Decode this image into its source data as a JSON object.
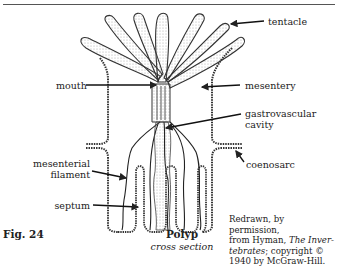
{
  "figure": {
    "number": "Fig. 24",
    "title": "Polyp",
    "subtitle": "cross section"
  },
  "labels": {
    "tentacle": "tentacle",
    "mouth": "mouth",
    "mesentery": "mesentery",
    "gastrovascular_line1": "gastrovascular",
    "gastrovascular_line2": "cavity",
    "coenosarc": "coenosarc",
    "mesenterial_line1": "mesenterial",
    "mesenterial_line2": "filament",
    "septum": "septum"
  },
  "credit": {
    "line1": "Redrawn, by permission,",
    "line2_pre": "from Hyman, ",
    "line2_italic": "The Inver-",
    "line3_italic": "tebrates",
    "line3_post": "; copyright ©",
    "line4": "1940 by McGraw-Hill."
  },
  "colors": {
    "ink": "#222222",
    "stipple": "#888888",
    "background": "#ffffff"
  }
}
